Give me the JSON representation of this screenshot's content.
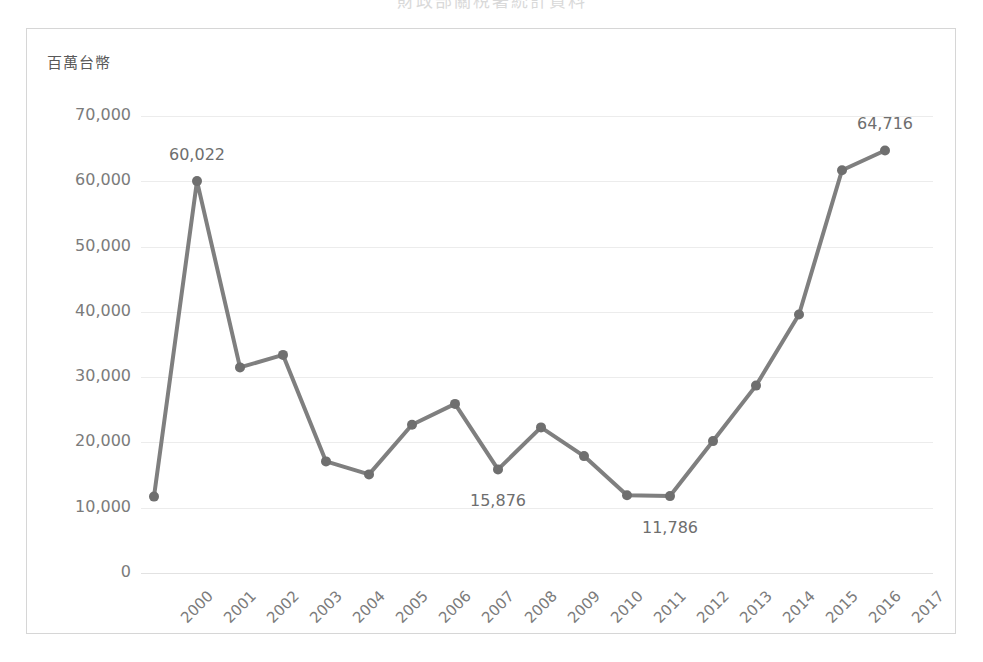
{
  "page": {
    "clipped_title": "財政部關稅署統計資料"
  },
  "chart_panel": {
    "axis_unit_label": "百萬台幣",
    "line_color": "#7f7f7f",
    "marker_color": "#6f6f6f",
    "gridline_color": "#ececec",
    "frame_color": "#d6d6d6",
    "tick_text_color": "#7b7b7b",
    "label_text_color": "#6e6e6e"
  },
  "chart_data": {
    "type": "line",
    "title": "",
    "xlabel": "",
    "ylabel": "百萬台幣",
    "ylim": [
      0,
      70000
    ],
    "ytick_labels": [
      "70,000",
      "60,000",
      "50,000",
      "40,000",
      "30,000",
      "20,000",
      "10,000",
      "0"
    ],
    "ytick_values": [
      70000,
      60000,
      50000,
      40000,
      30000,
      20000,
      10000,
      0
    ],
    "grid": true,
    "legend": false,
    "categories": [
      "2000",
      "2001",
      "2002",
      "2003",
      "2004",
      "2005",
      "2006",
      "2007",
      "2008",
      "2009",
      "2010",
      "2011",
      "2012",
      "2013",
      "2014",
      "2015",
      "2016",
      "2017"
    ],
    "values": [
      11700,
      60022,
      31500,
      33400,
      17100,
      15100,
      22700,
      25900,
      15876,
      22300,
      17900,
      11900,
      11786,
      20200,
      28700,
      39600,
      61700,
      64716
    ],
    "point_labels": [
      {
        "category": "2001",
        "value": 60022,
        "text": "60,022",
        "position": "above"
      },
      {
        "category": "2008",
        "value": 15876,
        "text": "15,876",
        "position": "below"
      },
      {
        "category": "2012",
        "value": 11786,
        "text": "11,786",
        "position": "below"
      },
      {
        "category": "2017",
        "value": 64716,
        "text": "64,716",
        "position": "above"
      }
    ]
  }
}
